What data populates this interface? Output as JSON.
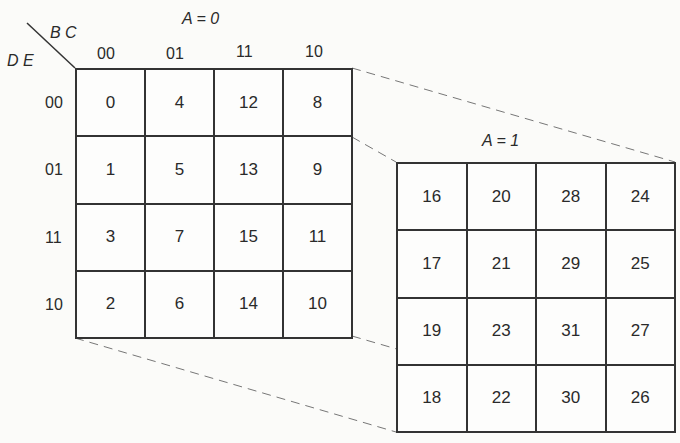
{
  "row_var_label": "D E",
  "col_var_label": "B C",
  "maps": [
    {
      "label": "A = 0",
      "col_headers": [
        "00",
        "01",
        "11",
        "10"
      ],
      "row_headers": [
        "00",
        "01",
        "11",
        "10"
      ],
      "cells": [
        [
          "0",
          "4",
          "12",
          "8"
        ],
        [
          "1",
          "5",
          "13",
          "9"
        ],
        [
          "3",
          "7",
          "15",
          "11"
        ],
        [
          "2",
          "6",
          "14",
          "10"
        ]
      ]
    },
    {
      "label": "A = 1",
      "cells": [
        [
          "16",
          "20",
          "28",
          "24"
        ],
        [
          "17",
          "21",
          "29",
          "25"
        ],
        [
          "19",
          "23",
          "31",
          "27"
        ],
        [
          "18",
          "22",
          "30",
          "26"
        ]
      ]
    }
  ],
  "colors": {
    "line": "#333333",
    "dash": "#777777",
    "background": "#fbfbf9"
  }
}
